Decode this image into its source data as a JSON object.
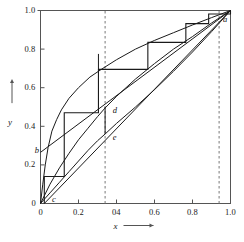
{
  "chart_data": {
    "type": "line",
    "title": "",
    "xlabel": "x",
    "ylabel": "y",
    "xlim": [
      0,
      1
    ],
    "ylim": [
      0,
      1
    ],
    "grid": false,
    "legend": null,
    "x_ticks": [
      {
        "value": 0,
        "label": "0"
      },
      {
        "value": 0.2,
        "label": "0.2"
      },
      {
        "value": 0.4,
        "label": "04"
      },
      {
        "value": 0.6,
        "label": "0.6"
      },
      {
        "value": 0.8,
        "label": "0.8"
      },
      {
        "value": 1.0,
        "label": "1.0"
      }
    ],
    "y_ticks": [
      {
        "value": 0,
        "label": "0"
      },
      {
        "value": 0.2,
        "label": "0.2"
      },
      {
        "value": 0.4,
        "label": "0.4"
      },
      {
        "value": 0.6,
        "label": "0.6"
      },
      {
        "value": 0.8,
        "label": "0.8"
      },
      {
        "value": 1.0,
        "label": "1.0"
      }
    ],
    "series": [
      {
        "name": "equilibrium-curve",
        "type": "line",
        "points": [
          [
            0,
            0.0
          ],
          [
            0.012,
            0.1
          ],
          [
            0.025,
            0.2
          ],
          [
            0.04,
            0.29
          ],
          [
            0.06,
            0.375
          ],
          [
            0.085,
            0.435
          ],
          [
            0.11,
            0.485
          ],
          [
            0.15,
            0.545
          ],
          [
            0.2,
            0.6
          ],
          [
            0.26,
            0.655
          ],
          [
            0.32,
            0.695
          ],
          [
            0.4,
            0.745
          ],
          [
            0.5,
            0.8
          ],
          [
            0.6,
            0.845
          ],
          [
            0.7,
            0.885
          ],
          [
            0.8,
            0.925
          ],
          [
            0.9,
            0.963
          ],
          [
            1.0,
            1.0
          ]
        ]
      },
      {
        "name": "middle-operating-curve",
        "type": "line",
        "points": [
          [
            0,
            0
          ],
          [
            0.05,
            0.1
          ],
          [
            0.1,
            0.185
          ],
          [
            0.15,
            0.26
          ],
          [
            0.2,
            0.33
          ],
          [
            0.25,
            0.39
          ],
          [
            0.3,
            0.45
          ],
          [
            0.34,
            0.495
          ],
          [
            0.4,
            0.555
          ],
          [
            0.5,
            0.645
          ],
          [
            0.6,
            0.725
          ],
          [
            0.7,
            0.8
          ],
          [
            0.8,
            0.865
          ],
          [
            0.9,
            0.935
          ],
          [
            1.0,
            1.0
          ]
        ]
      },
      {
        "name": "lower-operating-curve",
        "type": "line",
        "points": [
          [
            0,
            0
          ],
          [
            0.05,
            0.055
          ],
          [
            0.1,
            0.11
          ],
          [
            0.15,
            0.165
          ],
          [
            0.2,
            0.22
          ],
          [
            0.25,
            0.275
          ],
          [
            0.3,
            0.325
          ],
          [
            0.34,
            0.36
          ],
          [
            0.4,
            0.415
          ],
          [
            0.5,
            0.5
          ],
          [
            0.6,
            0.59
          ],
          [
            0.7,
            0.685
          ],
          [
            0.8,
            0.785
          ],
          [
            0.9,
            0.89
          ],
          [
            1.0,
            1.0
          ]
        ]
      },
      {
        "name": "chord-line-b-to-a",
        "type": "line",
        "points": [
          [
            0,
            0.265
          ],
          [
            1.0,
            1.0
          ]
        ]
      },
      {
        "name": "chord-line-c-to-a",
        "type": "line",
        "points": [
          [
            0.02,
            0.0
          ],
          [
            1.0,
            1.0
          ]
        ]
      },
      {
        "name": "staircase-construction",
        "type": "step",
        "points": [
          [
            0.02,
            0.0
          ],
          [
            0.02,
            0.14
          ],
          [
            0.125,
            0.14
          ],
          [
            0.125,
            0.47
          ],
          [
            0.305,
            0.47
          ],
          [
            0.305,
            0.695
          ],
          [
            0.565,
            0.695
          ],
          [
            0.565,
            0.835
          ],
          [
            0.765,
            0.835
          ],
          [
            0.765,
            0.932
          ],
          [
            0.885,
            0.932
          ],
          [
            0.885,
            0.982
          ],
          [
            1.0,
            0.982
          ],
          [
            1.0,
            1.0
          ]
        ]
      }
    ],
    "dashed_verticals": [
      {
        "name": "dashed-line-d-e",
        "x": 0.34
      },
      {
        "name": "dashed-line-a",
        "x": 0.94
      }
    ],
    "tick_markers": [
      {
        "name": "tick-marker-upper",
        "x": 0.305,
        "y_from": 0.695,
        "y_to": 0.775
      },
      {
        "name": "tick-marker-lower",
        "x": 0.34,
        "y_from": 0.36,
        "y_to": 0.5
      }
    ],
    "point_labels": [
      {
        "name": "point-label-a",
        "text": "a",
        "x": 0.955,
        "y": 0.955
      },
      {
        "name": "point-label-b",
        "text": "b",
        "x": -0.035,
        "y": 0.275
      },
      {
        "name": "point-label-c",
        "text": "c",
        "x": 0.055,
        "y": 0.022
      },
      {
        "name": "point-label-d",
        "text": "d",
        "x": 0.375,
        "y": 0.485
      },
      {
        "name": "point-label-e",
        "text": "e",
        "x": 0.375,
        "y": 0.345
      }
    ],
    "colors": {
      "line": "#1a1a1a",
      "axis": "#555555",
      "dashed": "#777777",
      "background": "#ffffff"
    }
  }
}
